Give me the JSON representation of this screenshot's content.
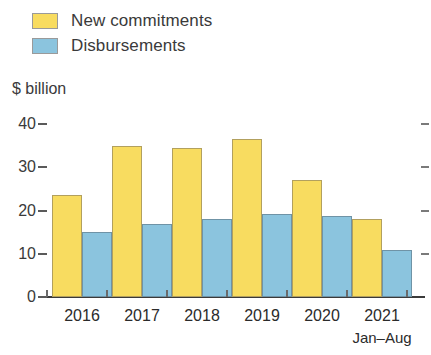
{
  "legend": {
    "items": [
      {
        "label": "New commitments",
        "color": "#F8DC60",
        "icon": "legend-swatch-icon"
      },
      {
        "label": "Disbursements",
        "color": "#8BC4DE",
        "icon": "legend-swatch-icon"
      }
    ]
  },
  "axis": {
    "unit_label": "$ billion",
    "y_ticks": [
      "0",
      "10",
      "20",
      "30",
      "40"
    ],
    "x_sub_note": "Jan–Aug"
  },
  "chart_data": {
    "type": "bar",
    "title": "",
    "subtitle": "",
    "xlabel": "",
    "ylabel": "$ billion",
    "ylim": [
      0,
      40
    ],
    "yticks": [
      0,
      10,
      20,
      30,
      40
    ],
    "grid": false,
    "legend_position": "top-left",
    "categories": [
      "2016",
      "2017",
      "2018",
      "2019",
      "2020",
      "2021"
    ],
    "category_notes": [
      "",
      "",
      "",
      "",
      "",
      "Jan–Aug"
    ],
    "series": [
      {
        "name": "New commitments",
        "color": "#F8DC60",
        "values": [
          23.5,
          35.0,
          34.5,
          36.5,
          27.0,
          18.0
        ]
      },
      {
        "name": "Disbursements",
        "color": "#8BC4DE",
        "values": [
          15.0,
          16.8,
          18.0,
          19.2,
          18.7,
          10.8
        ]
      }
    ]
  }
}
